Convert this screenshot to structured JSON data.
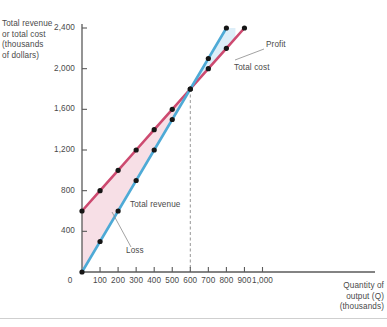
{
  "chart_data": {
    "type": "line",
    "title": "",
    "xlabel": "Quantity of output (Q) (thousands)",
    "ylabel": "Total revenue or total cost (thousands of dollars)",
    "xlim": [
      0,
      1000
    ],
    "ylim": [
      0,
      2600
    ],
    "grid": false,
    "legend_position": "inline-annotations",
    "x_ticks": [
      0,
      100,
      200,
      300,
      400,
      500,
      600,
      700,
      800,
      900,
      1000
    ],
    "x_tick_labels": [
      "0",
      "100",
      "200",
      "300",
      "400",
      "500",
      "600",
      "700",
      "800",
      "900",
      "1,000"
    ],
    "y_ticks": [
      0,
      400,
      800,
      1200,
      1600,
      2000,
      2400
    ],
    "y_tick_labels": [
      "0",
      "400",
      "800",
      "1,200",
      "1,600",
      "2,000",
      "2,400"
    ],
    "series": [
      {
        "name": "Total cost",
        "color": "#cd4a70",
        "x": [
          0,
          100,
          200,
          300,
          400,
          500,
          600,
          700,
          800,
          900
        ],
        "values": [
          600,
          800,
          1000,
          1200,
          1400,
          1600,
          1800,
          2000,
          2200,
          2400
        ]
      },
      {
        "name": "Total revenue",
        "color": "#4eaad6",
        "x": [
          0,
          100,
          200,
          300,
          400,
          500,
          600,
          700,
          800
        ],
        "values": [
          0,
          300,
          600,
          900,
          1200,
          1500,
          1800,
          2100,
          2400
        ]
      }
    ],
    "regions": [
      {
        "name": "Loss",
        "fill": "#f7dfe6",
        "from_x": 0,
        "to_x": 600
      },
      {
        "name": "Profit",
        "fill": "#ddeef8",
        "from_x": 600,
        "to_x": 850
      }
    ],
    "breakeven": {
      "x": 600,
      "y": 1800,
      "marker": "dashed-vertical"
    },
    "annotations": [
      {
        "label": "Total revenue",
        "x": 130,
        "y": 205
      },
      {
        "label": "Loss",
        "x": 126,
        "y": 250
      },
      {
        "label": "Profit",
        "x": 266,
        "y": 45
      },
      {
        "label": "Total cost",
        "x": 234,
        "y": 68
      }
    ]
  },
  "axis": {
    "y_caption": "Total revenue\nor total cost\n(thousands\nof dollars)",
    "x_caption": "Quantity of\noutput (Q)\n(thousands)"
  },
  "labels": {
    "total_revenue": "Total revenue",
    "total_cost": "Total cost",
    "loss": "Loss",
    "profit": "Profit"
  }
}
